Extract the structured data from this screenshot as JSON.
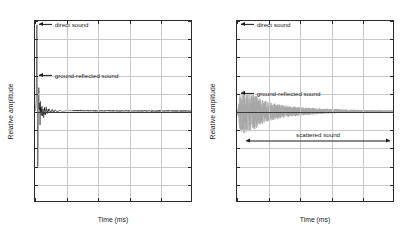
{
  "figure": {
    "background": "#ffffff",
    "panel_count": 2
  },
  "axis": {
    "xlabel": "Time (ms)",
    "ylabel": "Relative amplitude",
    "xticks": [
      "0",
      "10",
      "20",
      "30",
      "40",
      "50"
    ],
    "yticks": [
      "1",
      "0.8",
      "0.6",
      "0.4",
      "0.2",
      "0",
      "-0.2",
      "-0.4",
      "-0.6",
      "-0.8",
      "-1"
    ],
    "grid_color": "#c8c8c8",
    "frame_color": "#2b2b2b"
  },
  "left_panel": {
    "name": "impulse-response-no-scattering",
    "annotations": [
      {
        "label": "direct sound",
        "x_ms": 1.2,
        "y": 0.96,
        "marker": "arrow-left"
      },
      {
        "label": "ground-reflected sound",
        "x_ms": 1.2,
        "y": 0.4,
        "marker": "arrow-left"
      }
    ]
  },
  "right_panel": {
    "name": "impulse-response-with-scattering",
    "annotations": [
      {
        "label": "direct sound",
        "x_ms": 1.2,
        "y": 0.96,
        "marker": "arrow-left"
      },
      {
        "label": "ground-reflected sound",
        "x_ms": 1.2,
        "y": 0.2,
        "marker": "arrow-left"
      }
    ],
    "span_annotations": [
      {
        "label": "scattered sound",
        "y": -0.32,
        "x_start_ms": 2.8,
        "x_end_ms": 48.5,
        "marker": "double-arrow"
      }
    ]
  },
  "chart_data": [
    {
      "type": "line",
      "title": "",
      "panel": "left",
      "xlabel": "Time (ms)",
      "ylabel": "Relative amplitude",
      "xlim": [
        0,
        50
      ],
      "ylim": [
        -1,
        1
      ],
      "xticks": [
        0,
        10,
        20,
        30,
        40,
        50
      ],
      "yticks": [
        -1,
        -0.8,
        -0.6,
        -0.4,
        -0.2,
        0,
        0.2,
        0.4,
        0.6,
        0.8,
        1
      ],
      "grid": true,
      "legend": "none",
      "line_color": "#1a1a1a",
      "description": "Impulse response dominated by a direct sound spike near t=0 reaching +1 and a ground-reflected negative excursion to about -0.65, followed by rapid decay to near zero by t=10 ms and a flat tail to t=50 ms.",
      "series": [
        {
          "name": "impulse response",
          "x": [
            0,
            0.2,
            0.4,
            0.5,
            0.6,
            0.7,
            0.8,
            0.9,
            1.0,
            1.1,
            1.2,
            1.4,
            1.6,
            1.8,
            2.0,
            2.2,
            2.4,
            2.6,
            2.8,
            3.0,
            3.3,
            3.6,
            4.0,
            4.5,
            5.0,
            5.5,
            6.0,
            6.5,
            7.0,
            8.0,
            9.0,
            10.0,
            12.0,
            15.0,
            20.0,
            25.0,
            30.0,
            40.0,
            50.0
          ],
          "y": [
            0,
            0.02,
            0.12,
            0.55,
            1.0,
            0.42,
            -0.2,
            -0.65,
            -0.3,
            0.1,
            0.22,
            0.05,
            -0.12,
            0.08,
            -0.09,
            0.06,
            -0.07,
            0.05,
            -0.05,
            0.04,
            -0.035,
            0.03,
            -0.025,
            0.022,
            -0.018,
            0.016,
            -0.014,
            0.012,
            -0.01,
            0.008,
            -0.006,
            0.005,
            0.003,
            0.002,
            0.001,
            0.001,
            0.0005,
            0.0003,
            0.0002
          ]
        }
      ]
    },
    {
      "type": "line",
      "title": "",
      "panel": "right",
      "xlabel": "Time (ms)",
      "ylabel": "Relative amplitude",
      "xlim": [
        0,
        50
      ],
      "ylim": [
        -1,
        1
      ],
      "xticks": [
        0,
        10,
        20,
        30,
        40,
        50
      ],
      "yticks": [
        -1,
        -0.8,
        -0.6,
        -0.4,
        -0.2,
        0,
        0.2,
        0.4,
        0.6,
        0.8,
        1
      ],
      "grid": true,
      "legend": "none",
      "line_color": "#9a9a9a",
      "description": "Impulse response with a dense noisy scattered-sound tail: initial oscillations reach roughly +0.22 / -0.25 near t=1-6 ms, decaying gradually toward zero by t=35 ms with a low-level tail persisting to t=50 ms.",
      "series": [
        {
          "name": "impulse response with scattering",
          "envelope_x": [
            0,
            1,
            2,
            4,
            6,
            8,
            10,
            13,
            16,
            20,
            25,
            30,
            35,
            40,
            45,
            50
          ],
          "envelope_y": [
            0.02,
            0.22,
            0.24,
            0.22,
            0.19,
            0.14,
            0.11,
            0.085,
            0.065,
            0.05,
            0.035,
            0.025,
            0.018,
            0.013,
            0.01,
            0.008
          ]
        }
      ]
    }
  ]
}
